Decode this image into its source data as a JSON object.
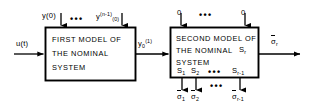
{
  "diagram": {
    "background_color": "#ffffff",
    "line_color": "#000000",
    "blocks": [
      {
        "id": "first-model",
        "lines": [
          "FIRST  MODEL  OF",
          "THE  NOMINAL",
          "SYSTEM"
        ],
        "line1": "FIRST  MODEL  OF",
        "line2": "THE  NOMINAL",
        "line3": "SYSTEM"
      },
      {
        "id": "second-model",
        "line1": "SECOND  MODEL  OF",
        "line2": "THE  NOMINAL",
        "line3": "SYSTEM",
        "corner_label": "S",
        "corner_label_sub": "r",
        "state_labels": [
          {
            "base": "S",
            "sub": "1"
          },
          {
            "base": "S",
            "sub": "2"
          },
          {
            "base": "S",
            "sub": "r-1"
          }
        ]
      }
    ],
    "signals": {
      "input_u": "u(t)",
      "intermediate_base": "y",
      "intermediate_sub": "0",
      "intermediate_sup": "(1)",
      "initial_condition_first": "y(0)",
      "initial_condition_last_base": "y",
      "initial_condition_last_sup": "(n-1)",
      "initial_condition_last_suffix": "(0)",
      "zero_input_left": "0",
      "zero_input_right": "0",
      "output_base": "σ",
      "output_sub": "r",
      "bottom_outputs": [
        {
          "base": "σ",
          "sub": "1"
        },
        {
          "base": "σ",
          "sub": "2"
        },
        {
          "base": "σ",
          "sub": "r-1"
        }
      ]
    },
    "ellipsis": {
      "glyph": "•••",
      "count": 4
    }
  }
}
